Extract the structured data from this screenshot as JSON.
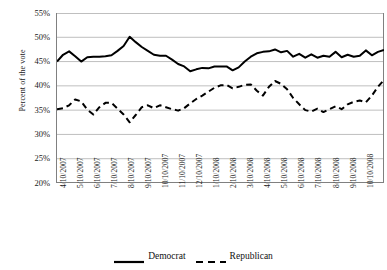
{
  "chart_data": {
    "type": "line",
    "title": "",
    "xlabel": "",
    "ylabel": "Percent of the vote",
    "ylim": [
      20,
      55
    ],
    "ytick_values": [
      55,
      50,
      45,
      40,
      35,
      30,
      25,
      20
    ],
    "ytick_labels": [
      "55%",
      "50%",
      "45%",
      "40%",
      "35%",
      "30%",
      "25%",
      "20%"
    ],
    "grid": true,
    "legend_position": "bottom-center",
    "x_tick_labels": [
      "4/10/2007",
      "5/10/2007",
      "6/10/2007",
      "7/10/2007",
      "8/10/2007",
      "9/10/2007",
      "10/10/2007",
      "11/10/2007",
      "12/10/2007",
      "1/10/2008",
      "2/10/2008",
      "3/10/2008",
      "4/10/2008",
      "5/10/2008",
      "6/10/2008",
      "7/10/2008",
      "8/10/2008",
      "9/10/2008",
      "10/10/2008"
    ],
    "series": [
      {
        "name": "Democrat",
        "style": "solid",
        "color": "#000000",
        "values": [
          45.0,
          46.4,
          47.1,
          46.1,
          45.0,
          45.9,
          46.0,
          46.0,
          46.1,
          46.3,
          47.2,
          48.2,
          50.1,
          49.0,
          48.0,
          47.2,
          46.4,
          46.2,
          46.2,
          45.4,
          44.5,
          44.0,
          43.0,
          43.4,
          43.7,
          43.6,
          44.0,
          44.0,
          44.0,
          43.2,
          43.8,
          45.0,
          46.0,
          46.7,
          47.0,
          47.1,
          47.5,
          46.9,
          47.2,
          46.0,
          46.6,
          45.8,
          46.5,
          45.8,
          46.2,
          46.0,
          47.0,
          45.9,
          46.4,
          46.0,
          46.2,
          47.3,
          46.3,
          47.0,
          47.4
        ]
      },
      {
        "name": "Republican",
        "style": "dashed",
        "color": "#000000",
        "values": [
          35.2,
          35.4,
          36.0,
          37.2,
          36.8,
          35.1,
          34.1,
          35.6,
          36.5,
          36.5,
          35.3,
          34.1,
          32.5,
          34.0,
          35.6,
          36.0,
          35.4,
          36.0,
          35.6,
          35.2,
          34.9,
          35.4,
          36.4,
          37.3,
          38.0,
          38.8,
          39.6,
          40.1,
          40.2,
          39.5,
          39.8,
          40.2,
          40.3,
          39.0,
          38.0,
          39.8,
          41.0,
          40.4,
          39.3,
          37.5,
          36.2,
          35.0,
          34.7,
          35.3,
          34.6,
          35.2,
          35.8,
          35.2,
          36.2,
          36.7,
          37.0,
          36.6,
          38.0,
          39.8,
          41.2
        ]
      }
    ]
  },
  "legend": {
    "entries": [
      {
        "label": "Democrat",
        "style": "solid"
      },
      {
        "label": "Republican",
        "style": "dashed"
      }
    ]
  }
}
